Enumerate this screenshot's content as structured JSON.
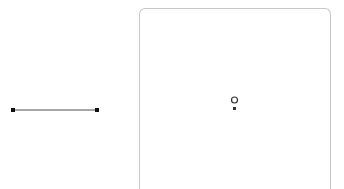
{
  "diagram": {
    "segment": {
      "start": {
        "x": 13,
        "y": 110
      },
      "end": {
        "x": 97,
        "y": 110
      },
      "line_color": "#8a8a8a",
      "point_color": "#111111"
    },
    "card": {
      "border_color": "#c8c8c8",
      "hollow_point": {
        "x": 95,
        "y": 91,
        "r": 3
      },
      "solid_point": {
        "x": 95,
        "y": 99
      },
      "point_color": "#333333"
    }
  }
}
